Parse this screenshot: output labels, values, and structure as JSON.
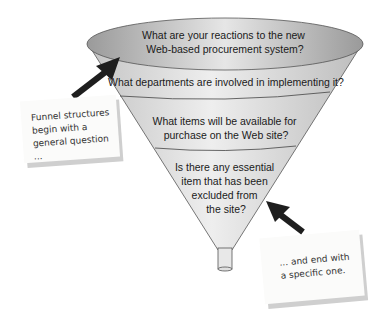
{
  "funnel": {
    "levels": [
      {
        "lines": [
          "What are your reactions to the new",
          "Web-based procurement system?"
        ]
      },
      {
        "lines": [
          "What departments are involved in implementing it?"
        ]
      },
      {
        "lines": [
          "What items will be available for",
          "purchase on the Web site?"
        ]
      },
      {
        "lines": [
          "Is there any essential",
          "item that has been",
          "excluded from",
          "the site?"
        ]
      }
    ]
  },
  "notes": {
    "left": {
      "lines": [
        "Funnel structures",
        "begin with a",
        "general question ..."
      ]
    },
    "right": {
      "lines": [
        "... and end with",
        "a specific one."
      ]
    }
  },
  "colors": {
    "funnel_fill": "#d9d9d9",
    "ellipse_fill": "#b8b8b8",
    "arrow": "#1e1e1e",
    "outline": "#555555"
  }
}
